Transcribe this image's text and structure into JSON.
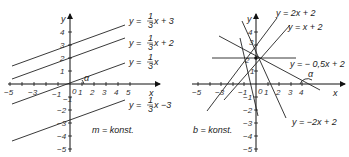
{
  "left_panel": {
    "axis_x_label": "x",
    "axis_y_label": "y",
    "origin_label": "0",
    "angle_label": "α",
    "note": "m = konst.",
    "x_ticks": [
      "−5",
      "−3",
      "−1",
      "1",
      "2",
      "3",
      "4",
      "5"
    ],
    "y_ticks": [
      "4",
      "3",
      "2",
      "1",
      "−1",
      "−2",
      "−3",
      "−4",
      "−5"
    ],
    "lines": [
      {
        "label_pre": "y = ",
        "frac_num": "1",
        "frac_den": "3",
        "label_post": "x + 3"
      },
      {
        "label_pre": "y = ",
        "frac_num": "1",
        "frac_den": "3",
        "label_post": "x + 2"
      },
      {
        "label_pre": "y = ",
        "frac_num": "1",
        "frac_den": "3",
        "label_post": "x"
      },
      {
        "label_pre": "y = ",
        "frac_num": "1",
        "frac_den": "3",
        "label_post": "x −3"
      }
    ]
  },
  "right_panel": {
    "axis_x_label": "x",
    "axis_y_label": "y",
    "origin_label": "0",
    "angle_label": "α",
    "note": "b = konst.",
    "x_ticks": [
      "−5",
      "−3",
      "−1",
      "1",
      "2",
      "3",
      "4"
    ],
    "y_ticks": [
      "4",
      "3",
      "2",
      "1",
      "−1",
      "−2",
      "−3",
      "−4",
      "−5"
    ],
    "lines": [
      {
        "label": "y = 2x + 2"
      },
      {
        "label": "y = x + 2"
      },
      {
        "label": "y = − 0,5x + 2"
      },
      {
        "label": "y = −2x + 2"
      }
    ]
  }
}
